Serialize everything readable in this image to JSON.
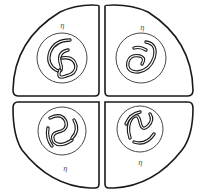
{
  "figure": {
    "cells": [
      {
        "position": "top-left",
        "label": "η"
      },
      {
        "position": "top-right",
        "label": "η"
      },
      {
        "position": "bottom-left",
        "label": "η"
      },
      {
        "position": "bottom-right",
        "label": "η"
      }
    ]
  },
  "colors": {
    "outline": "#1a1a1a",
    "background": "#ffffff"
  }
}
